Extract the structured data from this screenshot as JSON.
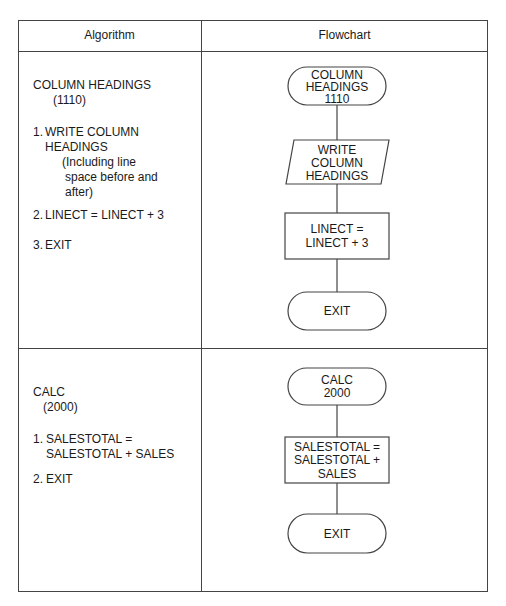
{
  "table": {
    "headers": [
      "Algorithm",
      "Flowchart"
    ]
  },
  "rows": [
    {
      "algorithm": {
        "title": "COLUMN HEADINGS",
        "code": "(1110)",
        "steps": [
          {
            "number": "1.",
            "lines": [
              "WRITE COLUMN",
              "HEADINGS"
            ],
            "note": [
              "(Including line",
              "space before and",
              "after)"
            ]
          },
          {
            "number": "2.",
            "lines": [
              "LINECT = LINECT + 3"
            ]
          },
          {
            "number": "3.",
            "lines": [
              "EXIT"
            ]
          }
        ]
      },
      "flowchart": [
        {
          "shape": "terminal",
          "lines": [
            "COLUMN",
            "HEADINGS",
            "1110"
          ]
        },
        {
          "shape": "input-output",
          "lines": [
            "WRITE",
            "COLUMN",
            "HEADINGS"
          ]
        },
        {
          "shape": "process",
          "lines": [
            "LINECT =",
            "LINECT + 3"
          ]
        },
        {
          "shape": "terminal",
          "lines": [
            "EXIT"
          ]
        }
      ]
    },
    {
      "algorithm": {
        "title": "CALC",
        "code": "(2000)",
        "steps": [
          {
            "number": "1.",
            "lines": [
              "SALESTOTAL =",
              "SALESTOTAL + SALES"
            ]
          },
          {
            "number": "2.",
            "lines": [
              "EXIT"
            ]
          }
        ]
      },
      "flowchart": [
        {
          "shape": "terminal",
          "lines": [
            "CALC",
            "2000"
          ]
        },
        {
          "shape": "process",
          "lines": [
            "SALESTOTAL =",
            "SALESTOTAL +",
            "SALES"
          ]
        },
        {
          "shape": "terminal",
          "lines": [
            "EXIT"
          ]
        }
      ]
    }
  ],
  "colors": {
    "line": "#444444",
    "text": "#1a1a1a",
    "background": "#ffffff"
  }
}
